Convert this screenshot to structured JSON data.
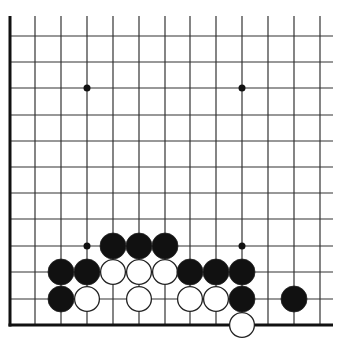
{
  "diagram": {
    "type": "go-board-corner",
    "grid": {
      "columns_x": [
        35,
        61,
        87,
        113,
        139,
        165,
        190,
        216,
        242,
        268,
        294,
        320
      ],
      "rows_y": [
        36,
        62,
        88,
        115,
        141,
        167,
        193,
        219,
        246,
        272,
        299
      ],
      "left_edge_x": 10,
      "bottom_edge_y": 325,
      "top_y": 16,
      "right_x": 333,
      "line_color": "#333333",
      "edge_color": "#111111"
    },
    "hoshi": [
      {
        "x": 87,
        "y": 88
      },
      {
        "x": 242,
        "y": 88
      },
      {
        "x": 87,
        "y": 246
      },
      {
        "x": 242,
        "y": 246
      }
    ],
    "stone_radius": 13,
    "stones": [
      {
        "color": "black",
        "x": 113,
        "y": 246
      },
      {
        "color": "black",
        "x": 139,
        "y": 246
      },
      {
        "color": "black",
        "x": 165,
        "y": 246
      },
      {
        "color": "black",
        "x": 61,
        "y": 272
      },
      {
        "color": "black",
        "x": 87,
        "y": 272
      },
      {
        "color": "white",
        "x": 113,
        "y": 272
      },
      {
        "color": "white",
        "x": 139,
        "y": 272
      },
      {
        "color": "white",
        "x": 165,
        "y": 272
      },
      {
        "color": "black",
        "x": 190,
        "y": 272
      },
      {
        "color": "black",
        "x": 216,
        "y": 272
      },
      {
        "color": "black",
        "x": 242,
        "y": 272
      },
      {
        "color": "black",
        "x": 61,
        "y": 299
      },
      {
        "color": "white",
        "x": 87,
        "y": 299
      },
      {
        "color": "white",
        "x": 139,
        "y": 299
      },
      {
        "color": "white",
        "x": 190,
        "y": 299
      },
      {
        "color": "white",
        "x": 216,
        "y": 299
      },
      {
        "color": "black",
        "x": 242,
        "y": 299
      },
      {
        "color": "black",
        "x": 294,
        "y": 299
      },
      {
        "color": "white",
        "x": 242,
        "y": 325
      }
    ]
  }
}
